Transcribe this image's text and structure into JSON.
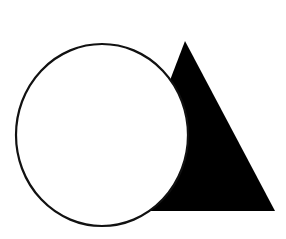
{
  "canvas": {
    "width": 286,
    "height": 239,
    "background": "#ffffff"
  },
  "shapes": {
    "triangle": {
      "label": "filled-triangle",
      "points": "185,41 275,211 120,211",
      "fill": "#000000"
    },
    "circle": {
      "label": "outlined-circle",
      "cx": 102,
      "cy": 135,
      "rx": 86,
      "ry": 91,
      "fill": "#ffffff",
      "stroke": "#111111",
      "stroke_width": 2.2
    }
  }
}
